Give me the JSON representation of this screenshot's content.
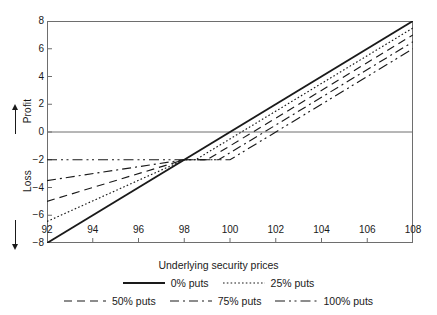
{
  "chart_data": {
    "type": "line",
    "title": "",
    "xlabel": "Underlying security prices",
    "ylabel": "Loss ← | → Profit",
    "ylabel_parts": [
      "Profit",
      "Loss"
    ],
    "xlim": [
      92,
      108
    ],
    "ylim": [
      -8,
      8
    ],
    "xticks": [
      92,
      94,
      96,
      98,
      100,
      102,
      104,
      106,
      108
    ],
    "yticks": [
      8,
      6,
      4,
      2,
      0,
      -2,
      -4,
      -6,
      -8
    ],
    "grid": false,
    "zero_line": true,
    "legend_position": "below",
    "x": [
      92,
      94,
      96,
      98,
      100,
      102,
      104,
      106,
      108
    ],
    "series": [
      {
        "name": "0% puts",
        "style": "solid",
        "values": [
          -8.0,
          -6.0,
          -4.0,
          -2.0,
          0.0,
          2.0,
          4.0,
          6.0,
          8.0
        ]
      },
      {
        "name": "25% puts",
        "style": "dotted",
        "kink_x": 98.5,
        "values": [
          -6.45,
          -4.95,
          -3.45,
          -2.0,
          -0.25,
          1.65,
          3.6,
          5.55,
          7.5
        ]
      },
      {
        "name": "50% puts",
        "style": "dashed",
        "kink_x": 99.0,
        "values": [
          -5.0,
          -4.0,
          -3.0,
          -2.0,
          -0.8,
          1.2,
          3.2,
          5.1,
          7.0
        ]
      },
      {
        "name": "75% puts",
        "style": "dashdot",
        "kink_x": 99.5,
        "values": [
          -3.5,
          -3.0,
          -2.5,
          -2.0,
          -1.4,
          0.7,
          2.65,
          4.5,
          6.5
        ]
      },
      {
        "name": "100% puts",
        "style": "dashdotdot",
        "kink_x": 100.0,
        "values": [
          -2.0,
          -2.0,
          -2.0,
          -2.0,
          -2.0,
          0.0,
          2.0,
          4.0,
          6.0
        ]
      }
    ]
  },
  "axis": {
    "x_title": "Underlying security prices",
    "y_profit": "Profit",
    "y_loss": "Loss",
    "xticks": [
      "92",
      "94",
      "96",
      "98",
      "100",
      "102",
      "104",
      "106",
      "108"
    ],
    "yticks": [
      "8",
      "6",
      "4",
      "2",
      "0",
      "−2",
      "−4",
      "−6",
      "−8"
    ]
  },
  "legend": {
    "row1": [
      {
        "label": "0% puts",
        "style": "solid"
      },
      {
        "label": "25% puts",
        "style": "dotted"
      }
    ],
    "row2": [
      {
        "label": "50% puts",
        "style": "dashed"
      },
      {
        "label": "75% puts",
        "style": "dashdot"
      },
      {
        "label": "100% puts",
        "style": "dashdotdot"
      }
    ]
  },
  "colors": {
    "line": "#1a1a1a",
    "axis": "#6e6e6e",
    "zero_line": "#6e6e6e",
    "background": "#ffffff"
  }
}
